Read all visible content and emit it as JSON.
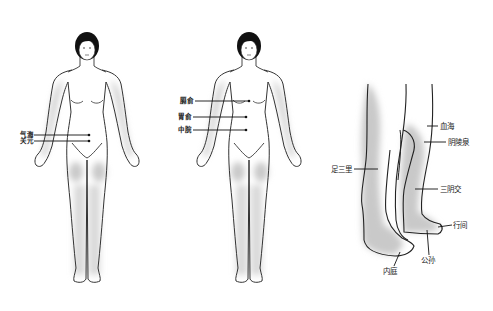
{
  "figures": [
    {
      "id": "front-figure-left",
      "acupoints": [
        {
          "label": "气海"
        },
        {
          "label": "关元"
        }
      ]
    },
    {
      "id": "front-figure-middle",
      "acupoints": [
        {
          "label": "膈俞"
        },
        {
          "label": "胃俞"
        },
        {
          "label": "中脘"
        }
      ]
    },
    {
      "id": "legs-side",
      "acupoints": [
        {
          "label": "血海"
        },
        {
          "label": "阴陵泉"
        },
        {
          "label": "足三里"
        },
        {
          "label": "三阴交"
        },
        {
          "label": "行间"
        },
        {
          "label": "公孙"
        },
        {
          "label": "内庭"
        }
      ]
    }
  ],
  "colors": {
    "skin": "#ffffff",
    "shade": "#c9c9c9",
    "hair": "#111111",
    "line": "#333333"
  }
}
